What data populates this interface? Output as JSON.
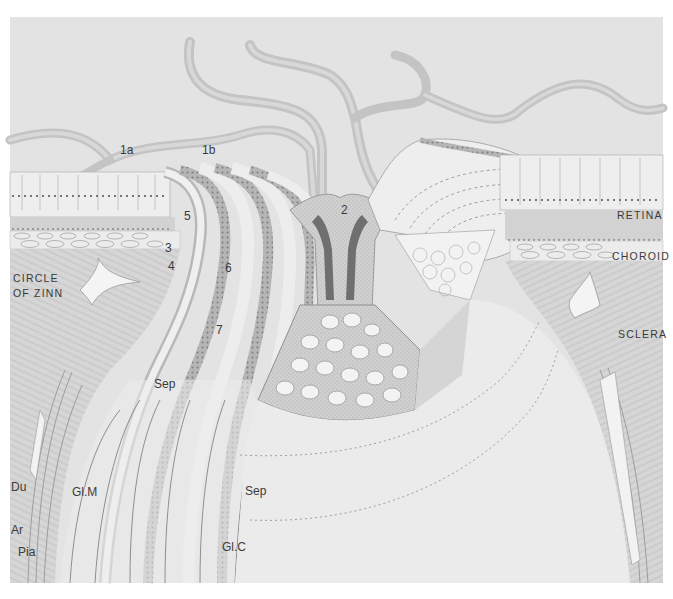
{
  "figure": {
    "style": "grayscale anatomical drawing"
  },
  "labels": {
    "layers": {
      "retina": "RETINA",
      "choroid": "CHOROID",
      "sclera": "SCLERA",
      "circle_of_zinn_line1": "CIRCLE",
      "circle_of_zinn_line2": "OF ZINN"
    },
    "numbers": {
      "n1a": "1a",
      "n1b": "1b",
      "n2": "2",
      "n3": "3",
      "n4": "4",
      "n5": "5",
      "n6": "6",
      "n7": "7"
    },
    "meninges": {
      "du": "Du",
      "ar": "Ar",
      "pia": "Pia"
    },
    "structures": {
      "sep_upper": "Sep",
      "sep_lower": "Sep",
      "glm": "Gl.M",
      "glc": "Gl.C"
    }
  },
  "colors": {
    "paper": "#ffffff",
    "plate_bg": "#e4e4e4",
    "tissue_light": "#efefef",
    "tissue_mid": "#cfcfcf",
    "tissue_dark": "#9a9a9a",
    "ink": "#3a3a3a",
    "vessel": "#c2c2c2"
  }
}
